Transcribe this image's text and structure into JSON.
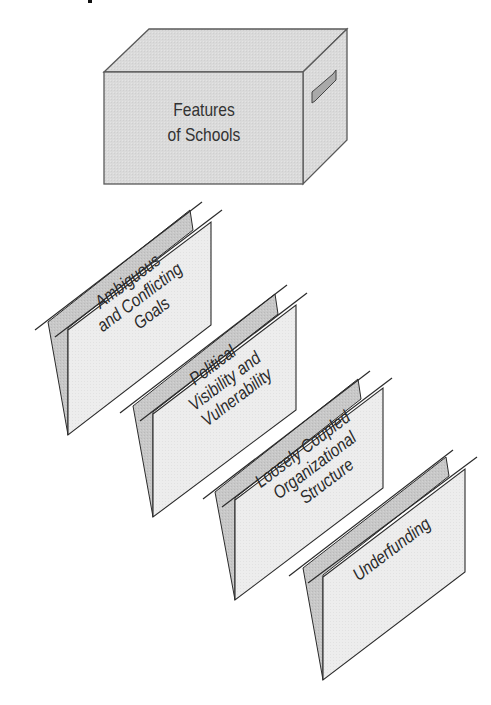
{
  "header_fragment": {
    "visible": true,
    "note_text": ""
  },
  "box": {
    "label_lines": [
      "Features",
      "of Schools"
    ],
    "colors": {
      "front": "#d9d9d9",
      "top": "#dedede",
      "side": "#d4d4d4",
      "handle": "#a9a9a9",
      "stroke": "#555555"
    }
  },
  "folders": [
    {
      "id": "goals",
      "lines": [
        "Ambiguous",
        "and Conflicting",
        "Goals"
      ]
    },
    {
      "id": "political",
      "lines": [
        "Political",
        "Visibility and",
        "Vulnerability"
      ]
    },
    {
      "id": "structure",
      "lines": [
        "Loosely Coupled",
        "Organizational",
        "Structure"
      ]
    },
    {
      "id": "underfunding",
      "lines": [
        "Underfunding"
      ]
    }
  ],
  "folder_colors": {
    "front": "#ececec",
    "back": "#c6c6c6",
    "stroke": "#2b2b2b"
  }
}
